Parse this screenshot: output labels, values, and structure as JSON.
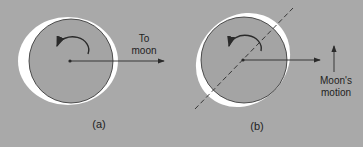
{
  "panels": [
    {
      "id": "a",
      "caption": "(a)",
      "arrow_label_line1": "To",
      "arrow_label_line2": "moon"
    },
    {
      "id": "b",
      "caption": "(b)",
      "motion_label_line1": "Moon's",
      "motion_label_line2": "motion"
    }
  ],
  "colors": {
    "background": "#a9a9a9",
    "bulge": "#ffffff",
    "earth": "#a4a4a4",
    "stroke": "#2a2a2a"
  }
}
